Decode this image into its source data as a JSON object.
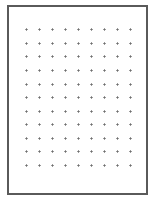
{
  "page": {
    "type": "dot-grid-sheet",
    "border_color": "#5a5a5a",
    "background_color": "#ffffff",
    "dot_color": "#9a9a9a"
  },
  "dot_grid": {
    "rows": 11,
    "columns": 9,
    "column_x": [
      26,
      39,
      52,
      65,
      78,
      91,
      104,
      117,
      130
    ],
    "row_y": [
      29,
      43,
      56,
      70,
      84,
      97,
      111,
      124,
      138,
      151,
      165
    ],
    "dot_glyph": "plus-dot-icon"
  }
}
